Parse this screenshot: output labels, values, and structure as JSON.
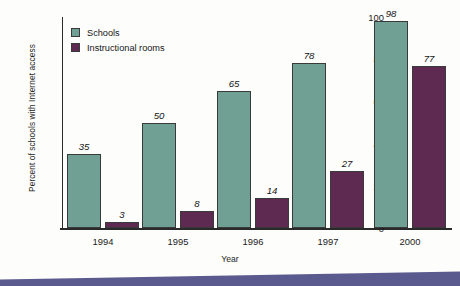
{
  "chart_data": {
    "type": "bar",
    "title": "",
    "xlabel": "Year",
    "ylabel": "Percent of schools with Internet access",
    "categories": [
      "1994",
      "1995",
      "1996",
      "1997",
      "2000"
    ],
    "series": [
      {
        "name": "Schools",
        "color": "#70a094",
        "values": [
          35,
          50,
          65,
          78,
          98
        ]
      },
      {
        "name": "Instructional rooms",
        "color": "#5e2a52",
        "values": [
          3,
          8,
          14,
          27,
          77
        ]
      }
    ],
    "ylim": [
      0,
      100
    ],
    "yticks": [
      0,
      20,
      40,
      60,
      80,
      100
    ],
    "ytick_labels": [
      "0",
      "20",
      "40",
      "60",
      "80",
      "100"
    ],
    "grid": false,
    "legend_position": "top-left",
    "value_labels_shown": true
  },
  "decoration": {
    "band_color": "#5b5a8e"
  }
}
